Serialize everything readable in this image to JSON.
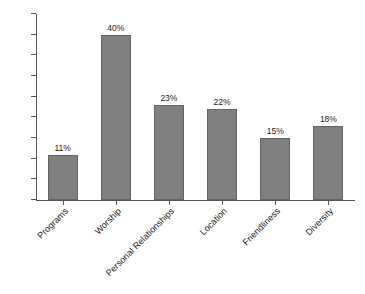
{
  "chart_data": {
    "type": "bar",
    "title": "",
    "subtitle": "",
    "xlabel": "",
    "ylabel": "",
    "categories": [
      "Programs",
      "Worship",
      "Personal Relationships",
      "Location",
      "Friendliness",
      "Diversity"
    ],
    "values": [
      11,
      40,
      23,
      22,
      15,
      18
    ],
    "value_labels": [
      "11%",
      "40%",
      "23%",
      "22%",
      "15%",
      "18%"
    ],
    "ylim": [
      0,
      45
    ],
    "ytick_values": [
      0,
      5,
      10,
      15,
      20,
      25,
      30,
      35,
      40,
      45
    ],
    "ytick_labels": [
      "0",
      "5",
      "10",
      "15",
      "20",
      "25",
      "30",
      "35",
      "40",
      "45%"
    ],
    "grid": false,
    "legend": false,
    "legend_position": "none",
    "colors": {
      "bar_fill": "#808080",
      "bar_border": "#636363",
      "axis": "#555555",
      "text": "#1a1a1a",
      "background": "#ffffff"
    }
  }
}
